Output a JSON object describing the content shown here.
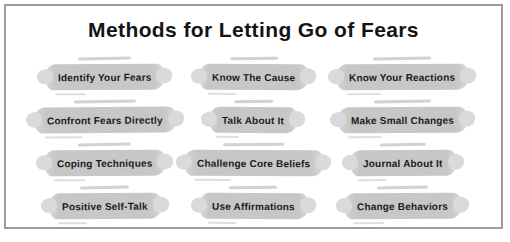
{
  "title": "Methods for Letting Go of Fears",
  "methods": [
    "Identify Your Fears",
    "Know The Cause",
    "Know Your Reactions",
    "Confront Fears Directly",
    "Talk About It",
    "Make Small Changes",
    "Coping Techniques",
    "Challenge Core Beliefs",
    "Journal About It",
    "Positive Self-Talk",
    "Use Affirmations",
    "Change Behaviors"
  ],
  "colors": {
    "background": "#ffffff",
    "frame_border": "#9c9c9c",
    "pill_fill": "#c7c7c7",
    "pill_smudge": "#dadada",
    "title_text": "#141414",
    "pill_text": "#1b1b1b"
  }
}
